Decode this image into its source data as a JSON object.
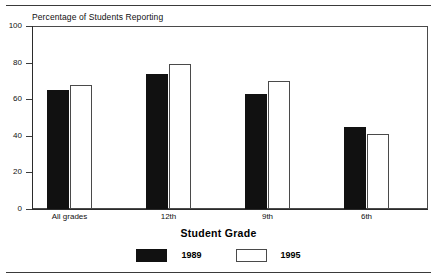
{
  "chart_data": {
    "type": "bar",
    "title": "Percentage of Students Reporting",
    "xlabel": "Student Grade",
    "ylabel": "",
    "ylim": [
      0,
      100
    ],
    "yticks": [
      0,
      20,
      40,
      60,
      80,
      100
    ],
    "grid": false,
    "legend_position": "bottom",
    "categories": [
      "All grades",
      "12th",
      "9th",
      "6th"
    ],
    "series": [
      {
        "name": "1989",
        "color": "#111111",
        "values": [
          65,
          74,
          63,
          45
        ]
      },
      {
        "name": "1995",
        "color": "#ffffff",
        "values": [
          68,
          79,
          70,
          41
        ]
      }
    ]
  },
  "figure": {
    "title": "Percentage of Students Reporting",
    "axis_title": "Student Grade",
    "ytick_labels": [
      "100",
      "80",
      "60",
      "40",
      "20",
      "0"
    ],
    "xtick_labels": [
      "All grades",
      "12th",
      "9th",
      "6th"
    ],
    "legend": [
      {
        "label": "1989"
      },
      {
        "label": "1995"
      }
    ]
  }
}
